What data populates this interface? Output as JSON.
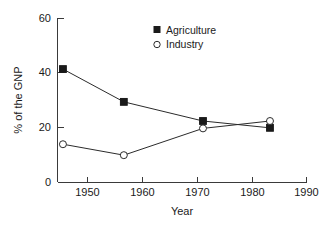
{
  "chart_data": {
    "type": "line",
    "title": "",
    "xlabel": "Year",
    "ylabel": "% of the GNP",
    "xlim": [
      1945,
      1990
    ],
    "ylim": [
      0,
      60
    ],
    "xticks": [
      1950,
      1960,
      1970,
      1980,
      1990
    ],
    "yticks": [
      0,
      20,
      40,
      60
    ],
    "grid": false,
    "legend_position": "top-center",
    "series": [
      {
        "name": "Agriculture",
        "marker": "filled-square",
        "x": [
          1950,
          1960,
          1973,
          1984
        ],
        "values": [
          41.5,
          29.5,
          22.5,
          20.0
        ]
      },
      {
        "name": "Industry",
        "marker": "open-circle",
        "x": [
          1950,
          1960,
          1973,
          1984
        ],
        "values": [
          14.0,
          10.0,
          19.8,
          22.5
        ]
      }
    ]
  },
  "axes": {
    "y_tick_labels": [
      "0",
      "20",
      "40",
      "60"
    ],
    "x_tick_labels": [
      "1950",
      "1960",
      "1970",
      "1980",
      "1990"
    ],
    "x_title": "Year",
    "y_title": "% of the GNP"
  },
  "legend": {
    "entries": [
      {
        "label": "Agriculture",
        "marker": "filled-square"
      },
      {
        "label": "Industry",
        "marker": "open-circle"
      }
    ]
  },
  "colors": {
    "axis": "#3a3a3a",
    "line": "#2b2b2b",
    "marker_fill": "#1a1a1a",
    "marker_open_fill": "#ffffff",
    "text": "#1a1a1a",
    "background": "#ffffff"
  }
}
